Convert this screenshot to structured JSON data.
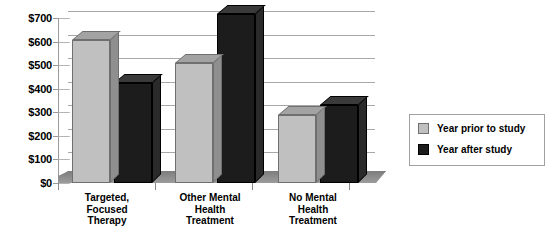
{
  "chart_data": {
    "type": "bar",
    "title": "",
    "subtitle": "",
    "xlabel": "",
    "ylabel": "",
    "ylim": [
      0,
      700
    ],
    "ytick_labels": [
      "$0",
      "$100",
      "$200",
      "$300",
      "$400",
      "$500",
      "$600",
      "$700"
    ],
    "ytick_values": [
      0,
      100,
      200,
      300,
      400,
      500,
      600,
      700
    ],
    "grid": true,
    "legend_position": "right",
    "style": "3d-grouped-bar",
    "categories": [
      "Targeted,\nFocused\nTherapy",
      "Other Mental\nHealth\nTreatment",
      "No Mental\nHealth\nTreatment"
    ],
    "categories_display": [
      [
        "Targeted,",
        "Focused",
        "Therapy"
      ],
      [
        "Other Mental",
        "Health",
        "Treatment"
      ],
      [
        "No Mental",
        "Health",
        "Treatment"
      ]
    ],
    "series": [
      {
        "name": "Year prior to study",
        "color": "#c0c0c0",
        "values": [
          605,
          510,
          290
        ]
      },
      {
        "name": "Year after study",
        "color": "#1c1c1c",
        "values": [
          425,
          715,
          330
        ]
      }
    ]
  },
  "legend": {
    "items": [
      {
        "label": "Year prior to study",
        "swatch": "light"
      },
      {
        "label": "Year after study",
        "swatch": "dark"
      }
    ]
  },
  "colors": {
    "series_light": "#c0c0c0",
    "series_dark": "#1c1c1c",
    "gridline": "#a8a8a8",
    "axis": "#9a9a9a",
    "floor": "#8e8e8e",
    "background": "#ffffff",
    "text": "#000000"
  }
}
